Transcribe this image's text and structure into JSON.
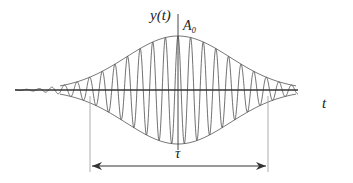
{
  "diagram": {
    "labels": {
      "y_axis": "y(t)",
      "amplitude": "A₀",
      "x_axis": "t",
      "duration": "τ"
    },
    "signal": {
      "envelope": "gaussian",
      "cycles_visible": 28
    },
    "colors": {
      "line": "#333333",
      "envelope": "#555555",
      "marker": "#999999"
    }
  }
}
